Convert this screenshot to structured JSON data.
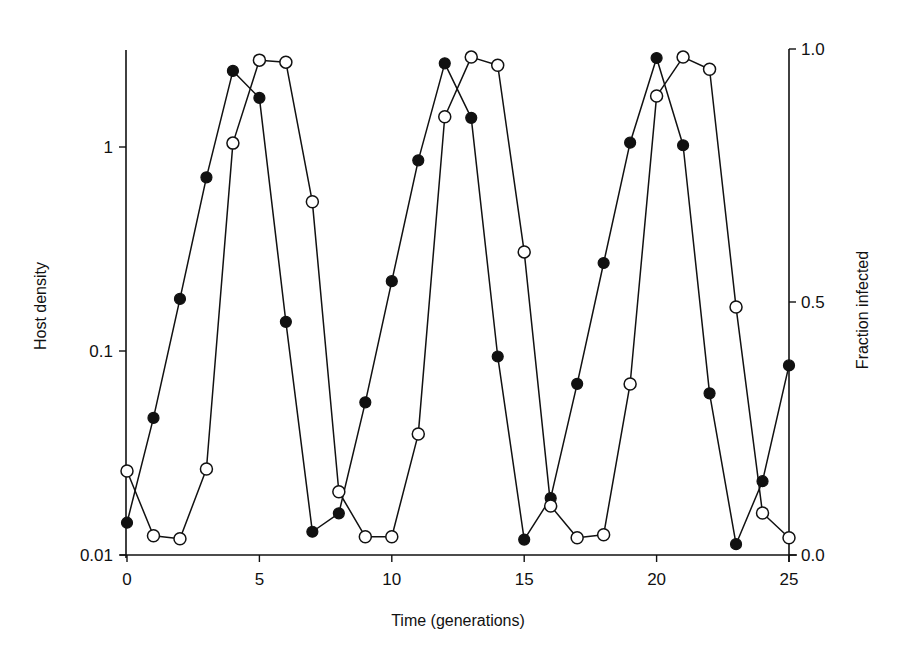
{
  "chart_data": {
    "type": "line",
    "title": "",
    "xlabel": "Time (generations)",
    "ylabel_left": "Host density",
    "ylabel_right": "Fraction infected",
    "xlim": [
      0,
      25
    ],
    "x_ticks": [
      0,
      5,
      10,
      15,
      20,
      25
    ],
    "x_tick_labels": [
      "0",
      "5",
      "10",
      "15",
      "20",
      "25"
    ],
    "y_left": {
      "scale": "log",
      "ylim": [
        0.01,
        3.0
      ],
      "ticks": [
        0.01,
        0.1,
        1
      ],
      "tick_labels": [
        "0.01",
        "0.1",
        "1"
      ]
    },
    "y_right": {
      "scale": "linear",
      "ylim": [
        0.0,
        1.0
      ],
      "ticks": [
        0.0,
        0.5,
        1.0
      ],
      "tick_labels": [
        "0.0",
        "0.5",
        "1.0"
      ]
    },
    "grid": false,
    "legend": "none",
    "x": [
      0,
      1,
      2,
      3,
      4,
      5,
      6,
      7,
      8,
      9,
      10,
      11,
      12,
      13,
      14,
      15,
      16,
      17,
      18,
      19,
      20,
      21,
      22,
      23,
      24,
      25
    ],
    "series": [
      {
        "name": "Host density",
        "axis": "left",
        "marker": "filled-circle",
        "values": [
          0.0144,
          0.047,
          0.18,
          0.71,
          2.36,
          1.74,
          0.139,
          0.013,
          0.016,
          0.056,
          0.22,
          0.86,
          2.57,
          1.39,
          0.094,
          0.0119,
          0.019,
          0.069,
          0.27,
          1.05,
          2.73,
          1.02,
          0.062,
          0.0113,
          0.023,
          0.085
        ]
      },
      {
        "name": "Fraction infected",
        "axis": "right",
        "marker": "open-circle",
        "values": [
          0.166,
          0.038,
          0.032,
          0.17,
          0.814,
          0.978,
          0.974,
          0.698,
          0.125,
          0.036,
          0.036,
          0.239,
          0.866,
          0.984,
          0.968,
          0.599,
          0.097,
          0.034,
          0.04,
          0.338,
          0.907,
          0.984,
          0.96,
          0.49,
          0.083,
          0.034
        ]
      }
    ]
  },
  "colors": {
    "ink": "#111111",
    "background": "#ffffff"
  }
}
